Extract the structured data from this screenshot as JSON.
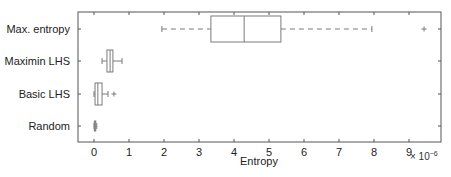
{
  "chart_data": {
    "type": "boxplot",
    "orientation": "horizontal",
    "title": "",
    "xlabel": "Entropy",
    "ylabel": "",
    "x_multiplier": "× 10^-6",
    "xlim": [
      -0.45,
      9.9
    ],
    "xticks": [
      0,
      1,
      2,
      3,
      4,
      5,
      6,
      7,
      8,
      9
    ],
    "grid": false,
    "legend": null,
    "categories": [
      "Max. entropy",
      "Maximin LHS",
      "Basic LHS",
      "Random"
    ],
    "series": [
      {
        "name": "Max. entropy",
        "whisker_low": 1.94,
        "q1": 3.34,
        "median": 4.29,
        "q3": 5.34,
        "whisker_high": 7.94,
        "outliers": [
          9.43
        ]
      },
      {
        "name": "Maximin LHS",
        "whisker_low": 0.23,
        "q1": 0.37,
        "median": 0.46,
        "q3": 0.54,
        "whisker_high": 0.8,
        "outliers": []
      },
      {
        "name": "Basic LHS",
        "whisker_low": 0.0,
        "q1": 0.03,
        "median": 0.11,
        "q3": 0.23,
        "whisker_high": 0.4,
        "outliers": [
          0.57
        ]
      },
      {
        "name": "Random",
        "whisker_low": 0.0,
        "q1": 0.01,
        "median": 0.03,
        "q3": 0.05,
        "whisker_high": 0.08,
        "outliers": []
      }
    ]
  },
  "labels": {
    "xlabel": "Entropy",
    "multiplier_base": "× 10",
    "multiplier_exp": "−6"
  },
  "colors": {
    "box": "#7a7a7a",
    "axis": "#555555",
    "text": "#222222"
  }
}
